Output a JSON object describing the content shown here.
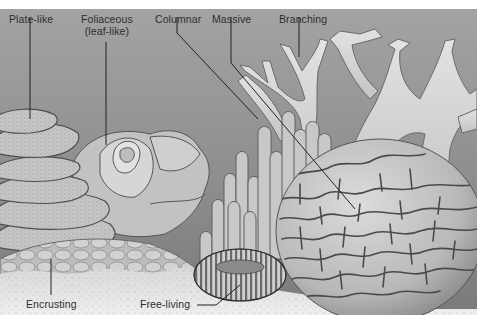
{
  "figure": {
    "labels": {
      "plate_like": "Plate-like",
      "foliaceous_line1": "Foliaceous",
      "foliaceous_line2": "(leaf-like)",
      "columnar": "Columnar",
      "massive": "Massive",
      "branching": "Branching",
      "encrusting": "Encrusting",
      "free_living": "Free-living"
    },
    "colors": {
      "water_top": "#9a9a9a",
      "water_bottom": "#7e7e7e",
      "coral_light": "#d6d6d6",
      "coral_mid": "#b4b4b4",
      "outline": "#4a4a4a",
      "sand": "#e4e4e4",
      "leader_line": "#222222"
    }
  }
}
